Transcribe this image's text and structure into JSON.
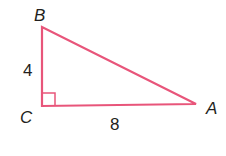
{
  "diagram": {
    "type": "right-triangle",
    "stroke_color": "#e8557a",
    "vertices": {
      "B": {
        "label": "B",
        "x": 42,
        "y": 27
      },
      "C": {
        "label": "C",
        "x": 42,
        "y": 106
      },
      "A": {
        "label": "A",
        "x": 196,
        "y": 104
      }
    },
    "sides": {
      "BC": {
        "label": "4"
      },
      "CA": {
        "label": "8"
      }
    },
    "right_angle_at": "C"
  }
}
